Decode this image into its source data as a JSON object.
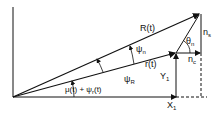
{
  "diagram": {
    "labels": {
      "R": "R(t)",
      "r": "r(t)",
      "psi_n": "ψ",
      "psi_n_sub": "n",
      "psi_R": "ψ",
      "psi_R_sub": "R",
      "theta_n": "θ",
      "theta_n_sub": "n",
      "n_s": "n",
      "n_s_sub": "s",
      "n_c": "n",
      "n_c_sub": "c",
      "Y1": "Y",
      "Y1_sub": "1",
      "X1": "X",
      "X1_sub": "1",
      "mu": "μ(t) + ψ",
      "mu_sub": "r",
      "mu_tail": "(t)"
    },
    "colors": {
      "stroke": "#111111"
    }
  }
}
